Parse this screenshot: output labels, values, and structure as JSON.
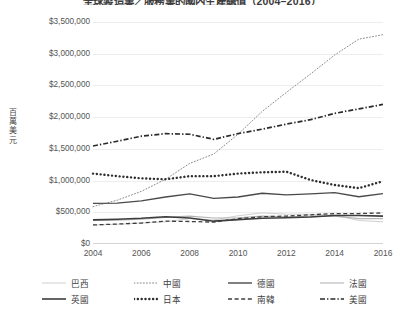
{
  "chart_data": {
    "type": "line",
    "title": "全球製造業／服務業的國內生產總值（2004–2016）",
    "xlabel": "",
    "ylabel": "百萬美元",
    "x": [
      2004,
      2005,
      2006,
      2007,
      2008,
      2009,
      2010,
      2011,
      2012,
      2013,
      2014,
      2015,
      2016
    ],
    "xtick_labels": [
      "2004",
      "2006",
      "2008",
      "2010",
      "2012",
      "2014",
      "2016"
    ],
    "xtick_values": [
      2004,
      2006,
      2008,
      2010,
      2012,
      2014,
      2016
    ],
    "xlim": [
      2004,
      2016
    ],
    "ylim": [
      0,
      3500000
    ],
    "ytick_labels": [
      "$0",
      "$500,000",
      "$1,000,000",
      "$1,500,000",
      "$2,000,000",
      "$2,500,000",
      "$3,000,000",
      "$3,500,000"
    ],
    "ytick_values": [
      0,
      500000,
      1000000,
      1500000,
      2000000,
      2500000,
      3000000,
      3500000
    ],
    "grid": true,
    "legend_position": "bottom",
    "series": [
      {
        "name": "巴西",
        "style": "solid-light",
        "color": "#d0d0d0",
        "width": 1,
        "values": [
          300000,
          310000,
          330000,
          350000,
          400000,
          380000,
          445000,
          490000,
          470000,
          470000,
          455000,
          370000,
          350000
        ]
      },
      {
        "name": "中國",
        "style": "dotted-fine",
        "color": "#8a8a8a",
        "width": 1,
        "values": [
          590000,
          690000,
          830000,
          1020000,
          1270000,
          1420000,
          1730000,
          2090000,
          2390000,
          2680000,
          2980000,
          3230000,
          3300000
        ]
      },
      {
        "name": "德國",
        "style": "solid-dark",
        "color": "#4a4a4a",
        "width": 1.4,
        "values": [
          640000,
          645000,
          680000,
          740000,
          790000,
          720000,
          740000,
          800000,
          775000,
          790000,
          810000,
          745000,
          795000
        ]
      },
      {
        "name": "法國",
        "style": "solid-gray",
        "color": "#b4b4b4",
        "width": 1.1,
        "values": [
          370000,
          375000,
          390000,
          420000,
          440000,
          410000,
          415000,
          440000,
          430000,
          440000,
          440000,
          400000,
          400000
        ]
      },
      {
        "name": "英國",
        "style": "solid-dark-thick",
        "color": "#3d3d3d",
        "width": 1.6,
        "values": [
          380000,
          390000,
          405000,
          430000,
          410000,
          360000,
          385000,
          405000,
          415000,
          425000,
          450000,
          450000,
          440000
        ]
      },
      {
        "name": "日本",
        "style": "dotted-thick",
        "color": "#2e2e2e",
        "width": 2.4,
        "values": [
          1110000,
          1070000,
          1035000,
          1020000,
          1070000,
          1070000,
          1110000,
          1130000,
          1140000,
          1010000,
          930000,
          880000,
          990000
        ]
      },
      {
        "name": "南韓",
        "style": "dashed",
        "color": "#3d3d3d",
        "width": 1.3,
        "values": [
          300000,
          315000,
          330000,
          360000,
          355000,
          345000,
          400000,
          430000,
          440000,
          460000,
          480000,
          480000,
          490000
        ]
      },
      {
        "name": "美國",
        "style": "dash-dot",
        "color": "#2b2b2b",
        "width": 1.7,
        "values": [
          1545000,
          1620000,
          1700000,
          1740000,
          1730000,
          1650000,
          1740000,
          1810000,
          1890000,
          1960000,
          2060000,
          2130000,
          2200000
        ]
      }
    ]
  },
  "legend": {
    "row1": [
      "巴西",
      "中國",
      "德國",
      "法國"
    ],
    "row2": [
      "英國",
      "日本",
      "南韓",
      "美國"
    ]
  }
}
